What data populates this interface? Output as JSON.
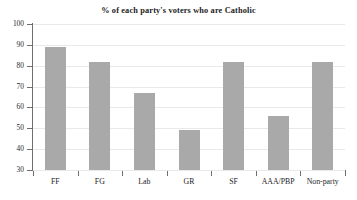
{
  "chart_data": {
    "type": "bar",
    "title": "% of each party's voters who are Catholic",
    "xlabel": "",
    "ylabel": "",
    "ylim": [
      30,
      100
    ],
    "yticks": [
      30,
      40,
      50,
      60,
      70,
      80,
      90,
      100
    ],
    "grid": true,
    "legend": false,
    "bar_color": "#a9a9a9",
    "categories": [
      "FF",
      "FG",
      "Lab",
      "GR",
      "SF",
      "AAA/PBP",
      "Non-party"
    ],
    "values": [
      89,
      82,
      67,
      49,
      82,
      56,
      82
    ]
  }
}
